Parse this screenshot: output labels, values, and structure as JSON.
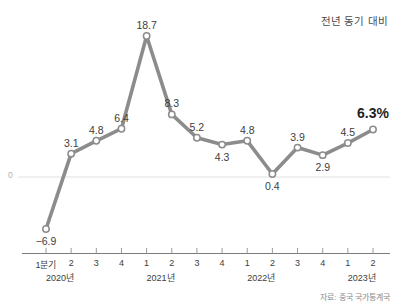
{
  "legend_note": "전년 동기 대비",
  "source_note": "자료: 중국 국가통계국",
  "zero_axis_label": "0",
  "colors": {
    "line": "#8c8c8c",
    "marker_fill": "#ffffff",
    "marker_stroke": "#8c8c8c",
    "axis": "#7a7a7a",
    "gridline": "#ebebeb",
    "label": "#3d3d3d",
    "final_label": "#1f1f1f"
  },
  "chart_data": {
    "type": "line",
    "title": "",
    "subtitle": "",
    "xlabel": "",
    "ylabel": "",
    "unit": "%",
    "grid": false,
    "legend_position": "top-right",
    "legend_entries": [
      "전년 동기 대비"
    ],
    "annotations": [
      "자료: 중국 국가통계국"
    ],
    "ylim": [
      -6.9,
      18.7
    ],
    "zero_line": 0,
    "categories": [
      "1분기",
      "2",
      "3",
      "4",
      "1",
      "2",
      "3",
      "4",
      "1",
      "2",
      "3",
      "4",
      "1",
      "2"
    ],
    "year_groups": [
      {
        "label": "2020년",
        "start_index": 0,
        "span": 4
      },
      {
        "label": "2021년",
        "start_index": 4,
        "span": 4
      },
      {
        "label": "2022년",
        "start_index": 8,
        "span": 4
      },
      {
        "label": "2023년",
        "start_index": 12,
        "span": 2
      }
    ],
    "series": [
      {
        "name": "전년 동기 대비",
        "values": [
          -6.9,
          3.1,
          4.8,
          6.4,
          18.7,
          8.3,
          5.2,
          4.3,
          4.8,
          0.4,
          3.9,
          2.9,
          4.5,
          6.3
        ]
      }
    ],
    "point_labels": [
      "−6.9",
      "3.1",
      "4.8",
      "6.4",
      "18.7",
      "8.3",
      "5.2",
      "4.3",
      "4.8",
      "0.4",
      "3.9",
      "2.9",
      "4.5",
      "6.3%"
    ],
    "label_placement": [
      "below",
      "above",
      "above",
      "above",
      "above",
      "above",
      "above",
      "below",
      "above",
      "below",
      "above",
      "below",
      "above",
      "above"
    ]
  }
}
